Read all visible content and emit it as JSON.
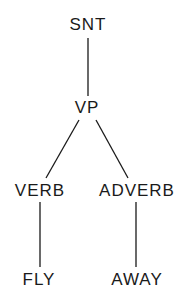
{
  "diagram": {
    "type": "parse-tree",
    "colors": {
      "line": "#1a1a1a",
      "text": "#1a1a1a",
      "background": "#ffffff"
    },
    "nodes": [
      {
        "id": "snt",
        "label": "SNT",
        "x": 88,
        "y": 16
      },
      {
        "id": "vp",
        "label": "VP",
        "x": 87,
        "y": 99
      },
      {
        "id": "verb",
        "label": "VERB",
        "x": 40,
        "y": 182
      },
      {
        "id": "adverb",
        "label": "ADVERB",
        "x": 137,
        "y": 182
      },
      {
        "id": "fly",
        "label": "FLY",
        "x": 39,
        "y": 271
      },
      {
        "id": "away",
        "label": "AWAY",
        "x": 137,
        "y": 271
      }
    ],
    "edges": [
      {
        "from": "snt",
        "to": "vp",
        "x1": 88,
        "y1": 38,
        "x2": 88,
        "y2": 96
      },
      {
        "from": "vp",
        "to": "verb",
        "x1": 79,
        "y1": 120,
        "x2": 46,
        "y2": 178
      },
      {
        "from": "vp",
        "to": "adverb",
        "x1": 96,
        "y1": 120,
        "x2": 128,
        "y2": 178
      },
      {
        "from": "verb",
        "to": "fly",
        "x1": 40,
        "y1": 202,
        "x2": 40,
        "y2": 267
      },
      {
        "from": "adverb",
        "to": "away",
        "x1": 136,
        "y1": 202,
        "x2": 136,
        "y2": 267
      }
    ]
  }
}
